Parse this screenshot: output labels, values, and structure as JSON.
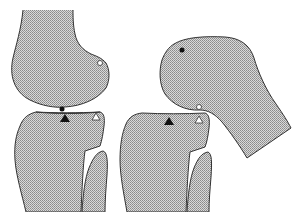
{
  "diagram": {
    "colors": {
      "bone_fill": "#bdbdbd",
      "bone_outline": "#333333",
      "background": "#ffffff",
      "marker_black": "#111111",
      "marker_white": "#ffffff"
    },
    "panels": [
      {
        "name": "extension",
        "parts": [
          "femur",
          "tibia",
          "fibula"
        ],
        "markers": [
          {
            "type": "filled-circle",
            "location": "femur contact point",
            "x": 62,
            "y": 109
          },
          {
            "type": "open-circle",
            "location": "posterior femoral condyle",
            "x": 100,
            "y": 63
          },
          {
            "type": "filled-triangle",
            "location": "tibial plateau contact",
            "x": 65,
            "y": 118
          },
          {
            "type": "open-triangle",
            "location": "posterior tibial plateau",
            "x": 96,
            "y": 117
          }
        ]
      },
      {
        "name": "flexion",
        "parts": [
          "femur",
          "tibia",
          "fibula"
        ],
        "markers": [
          {
            "type": "filled-circle",
            "location": "femur anterior condyle",
            "x": 182,
            "y": 50
          },
          {
            "type": "open-circle",
            "location": "femur contact point",
            "x": 199,
            "y": 107
          },
          {
            "type": "filled-triangle",
            "location": "tibial plateau",
            "x": 169,
            "y": 121
          },
          {
            "type": "open-triangle",
            "location": "posterior tibial plateau contact",
            "x": 199,
            "y": 120
          }
        ]
      }
    ]
  }
}
